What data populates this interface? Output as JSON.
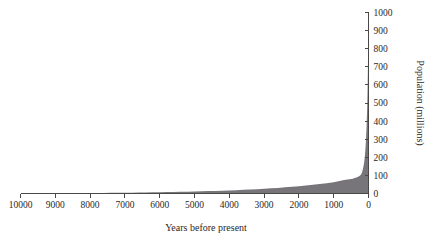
{
  "chart_data": {
    "type": "area",
    "title": "",
    "subtitle": "",
    "xlabel": "Years before present",
    "ylabel": "Population (millions)",
    "xlim": [
      10000,
      0
    ],
    "ylim": [
      0,
      1000
    ],
    "x_axis_reversed": true,
    "grid": false,
    "legend": false,
    "legend_position": "none",
    "y_axis_side": "right",
    "x_axis_side": "bottom",
    "xticks": [
      10000,
      9000,
      8000,
      7000,
      6000,
      5000,
      4000,
      3000,
      2000,
      1000,
      0
    ],
    "xtick_labels": [
      "10000",
      "9000",
      "8000",
      "7000",
      "6000",
      "5000",
      "4000",
      "3000",
      "2000",
      "1000",
      "0"
    ],
    "yticks": [
      0,
      100,
      200,
      300,
      400,
      500,
      600,
      700,
      800,
      900,
      1000
    ],
    "ytick_labels": [
      "0",
      "100",
      "200",
      "300",
      "400",
      "500",
      "600",
      "700",
      "800",
      "900",
      "1000"
    ],
    "series": [
      {
        "name": "World population",
        "fill_color": "#77757a",
        "x": [
          10000,
          9800,
          9600,
          9400,
          9200,
          9000,
          8800,
          8600,
          8400,
          8200,
          8000,
          7800,
          7600,
          7400,
          7200,
          7000,
          6800,
          6600,
          6400,
          6200,
          6000,
          5800,
          5600,
          5400,
          5200,
          5000,
          4800,
          4600,
          4400,
          4200,
          4000,
          3800,
          3600,
          3400,
          3200,
          3000,
          2800,
          2600,
          2400,
          2200,
          2000,
          1800,
          1600,
          1400,
          1200,
          1000,
          900,
          800,
          700,
          600,
          500,
          450,
          400,
          350,
          300,
          260,
          220,
          200,
          180,
          160,
          140,
          120,
          100,
          80,
          60,
          50,
          40,
          30,
          20,
          10,
          0
        ],
        "values": [
          1,
          1.1,
          1.2,
          1.3,
          1.5,
          1.6,
          1.8,
          2,
          2.2,
          2.4,
          2.7,
          3,
          3.3,
          3.6,
          4,
          4.4,
          4.8,
          5.3,
          5.8,
          6.4,
          7,
          7.7,
          8.4,
          9.2,
          10,
          11,
          12,
          13.2,
          14.4,
          15.7,
          17,
          18.6,
          20.2,
          22,
          24,
          26,
          28.5,
          31,
          34,
          37,
          40,
          44,
          48,
          52,
          57,
          62,
          66,
          70,
          74,
          77,
          80,
          82,
          85,
          88,
          92,
          96,
          103,
          110,
          120,
          135,
          155,
          180,
          215,
          270,
          350,
          400,
          460,
          540,
          650,
          800,
          1000
        ],
        "annotation": "World population grows exponentially, rising sharply in recent centuries"
      }
    ]
  },
  "axis_titles": {
    "x": "Years before present",
    "y": "Population (millions)"
  }
}
